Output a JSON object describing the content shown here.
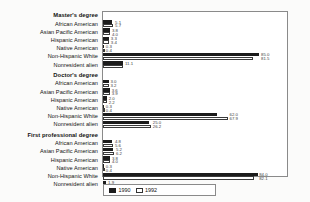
{
  "chart_data": {
    "type": "bar",
    "orientation": "horizontal",
    "title": "",
    "xlabel": "",
    "ylabel": "",
    "xlim": [
      0,
      100
    ],
    "grid": false,
    "legend_position": "bottom-left",
    "legend": [
      "1990",
      "1992"
    ],
    "series": [
      {
        "name": "1990",
        "color": "#1c1c1c"
      },
      {
        "name": "1992",
        "color": "#ffffff"
      }
    ],
    "groups": [
      {
        "label": "Master's degree",
        "categories": [
          "African American",
          "Asian Pacific American",
          "Hispanic American",
          "Native American",
          "Non-Hispanic White",
          "Nonresident alien"
        ],
        "values_1990": [
          5.1,
          3.8,
          3.3,
          0.3,
          85.0,
          11.1
        ],
        "values_1992": [
          5.7,
          4.0,
          3.4,
          0.4,
          81.5,
          11.1
        ],
        "labels_1990": [
          "5.1",
          "3.8",
          "3.3",
          "0.3",
          "85.0",
          "11.1"
        ],
        "labels_1992": [
          "5.7",
          "4.0",
          "3.4",
          "0.4",
          "81.5",
          ""
        ]
      },
      {
        "label": "Doctor's degree",
        "categories": [
          "African American",
          "Asian Pacific American",
          "Hispanic American",
          "Native American",
          "Non-Hispanic White",
          "Nonresident alien"
        ],
        "values_1990": [
          3.0,
          3.6,
          2.0,
          0.3,
          62.0,
          25.0
        ],
        "values_1992": [
          3.2,
          3.9,
          2.2,
          0.4,
          67.9,
          26.2
        ],
        "labels_1990": [
          "3.0",
          "3.6",
          "2.0",
          "0.3",
          "62.0",
          "25.0"
        ],
        "labels_1992": [
          "3.2",
          "3.9",
          "2.2",
          "0.4",
          "67.9",
          "26.2"
        ]
      },
      {
        "label": "First professional degree",
        "categories": [
          "African American",
          "Asian Pacific American",
          "Hispanic American",
          "Native American",
          "Non-Hispanic White",
          "Nonresident alien"
        ],
        "values_1990": [
          4.8,
          5.2,
          3.8,
          0.3,
          84.0,
          1.9
        ],
        "values_1992": [
          5.6,
          6.2,
          4.0,
          0.4,
          82.1,
          1.9
        ],
        "labels_1990": [
          "4.8",
          "5.2",
          "3.8",
          "0.3",
          "84.0",
          "1.9"
        ],
        "labels_1992": [
          "5.6",
          "6.2",
          "4.0",
          "0.4",
          "82.1",
          ""
        ]
      }
    ]
  }
}
